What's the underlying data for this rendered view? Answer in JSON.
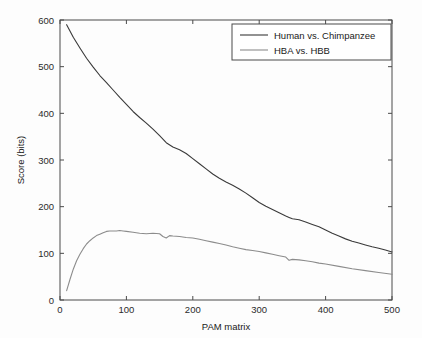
{
  "chart_data": {
    "type": "line",
    "title": "",
    "xlabel": "PAM matrix",
    "ylabel": "Score (bits)",
    "xlim": [
      0,
      500
    ],
    "ylim": [
      0,
      600
    ],
    "xticks": [
      0,
      100,
      200,
      300,
      400,
      500
    ],
    "yticks": [
      0,
      100,
      200,
      300,
      400,
      500,
      600
    ],
    "xtick_labels": [
      "0",
      "100",
      "200",
      "300",
      "400",
      "500"
    ],
    "ytick_labels": [
      "0",
      "100",
      "200",
      "300",
      "400",
      "500",
      "600"
    ],
    "grid": false,
    "legend_position": "top-right",
    "series": [
      {
        "name": "Human vs. Chimpanzee",
        "color": "#3a3a3a",
        "x": [
          10,
          20,
          30,
          40,
          50,
          60,
          70,
          80,
          90,
          100,
          110,
          120,
          130,
          140,
          150,
          160,
          170,
          180,
          190,
          200,
          210,
          220,
          230,
          240,
          250,
          260,
          270,
          280,
          290,
          300,
          310,
          320,
          330,
          340,
          345,
          350,
          360,
          370,
          380,
          390,
          400,
          410,
          420,
          430,
          440,
          450,
          460,
          470,
          480,
          490,
          500
        ],
        "values": [
          590,
          563,
          540,
          518,
          499,
          481,
          466,
          450,
          434,
          419,
          404,
          391,
          379,
          366,
          352,
          337,
          328,
          322,
          314,
          303,
          292,
          281,
          270,
          261,
          253,
          246,
          238,
          229,
          219,
          209,
          201,
          194,
          187,
          180,
          177,
          174,
          172,
          167,
          162,
          157,
          150,
          143,
          137,
          131,
          126,
          122,
          118,
          114,
          111,
          107,
          103
        ]
      },
      {
        "name": "HBA vs. HBB",
        "color": "#8c8c8c",
        "x": [
          10,
          15,
          20,
          25,
          30,
          35,
          40,
          45,
          50,
          55,
          60,
          65,
          70,
          75,
          80,
          85,
          90,
          95,
          100,
          110,
          120,
          130,
          140,
          150,
          155,
          160,
          165,
          170,
          180,
          190,
          200,
          210,
          220,
          230,
          240,
          250,
          260,
          270,
          280,
          290,
          300,
          310,
          320,
          330,
          340,
          345,
          350,
          360,
          370,
          380,
          390,
          400,
          420,
          440,
          460,
          480,
          500
        ],
        "values": [
          20,
          44,
          66,
          84,
          98,
          110,
          120,
          127,
          133,
          138,
          141,
          144,
          147,
          148,
          148,
          148,
          149,
          148,
          147,
          145,
          143,
          142,
          143,
          142,
          136,
          133,
          138,
          137,
          136,
          134,
          133,
          130,
          127,
          124,
          121,
          118,
          114,
          111,
          108,
          106,
          104,
          101,
          98,
          95,
          92,
          85,
          87,
          86,
          84,
          82,
          79,
          77,
          72,
          67,
          63,
          59,
          55
        ]
      }
    ]
  },
  "legend": {
    "entries": [
      {
        "label": "Human vs. Chimpanzee"
      },
      {
        "label": "HBA vs. HBB"
      }
    ]
  },
  "colors": {
    "axis": "#4a4a4a",
    "background": "#fdfdfd",
    "series_1": "#3a3a3a",
    "series_2": "#8c8c8c"
  }
}
